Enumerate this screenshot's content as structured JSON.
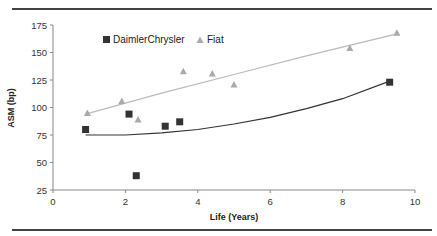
{
  "chart_data": {
    "type": "scatter",
    "title": "",
    "xlabel": "Life (Years)",
    "ylabel": "ASM (bp)",
    "xlim": [
      0,
      10
    ],
    "ylim": [
      25,
      175
    ],
    "xticks": [
      0,
      2,
      4,
      6,
      8,
      10
    ],
    "yticks": [
      25,
      50,
      75,
      100,
      125,
      150,
      175
    ],
    "grid": false,
    "legend_position": "top-left inside",
    "series": [
      {
        "name": "DaimlerChrysler",
        "marker": "square",
        "color": "#333333",
        "points": [
          [
            0.9,
            80
          ],
          [
            2.1,
            94
          ],
          [
            2.3,
            38
          ],
          [
            3.1,
            83
          ],
          [
            3.5,
            87
          ],
          [
            9.3,
            123
          ]
        ],
        "trendline": [
          [
            0.9,
            75
          ],
          [
            2,
            75
          ],
          [
            3,
            77
          ],
          [
            4,
            80
          ],
          [
            5,
            85
          ],
          [
            6,
            91
          ],
          [
            7,
            99
          ],
          [
            8,
            108
          ],
          [
            9.3,
            124
          ]
        ]
      },
      {
        "name": "Fiat",
        "marker": "triangle",
        "color": "#aaaaaa",
        "points": [
          [
            0.95,
            95
          ],
          [
            1.9,
            106
          ],
          [
            2.35,
            89
          ],
          [
            3.6,
            133
          ],
          [
            4.4,
            131
          ],
          [
            5.0,
            121
          ],
          [
            8.2,
            154
          ],
          [
            9.5,
            168
          ]
        ],
        "trendline": [
          [
            0.9,
            94
          ],
          [
            3,
            113
          ],
          [
            5,
            130
          ],
          [
            7,
            147
          ],
          [
            9.5,
            167
          ]
        ]
      }
    ]
  }
}
